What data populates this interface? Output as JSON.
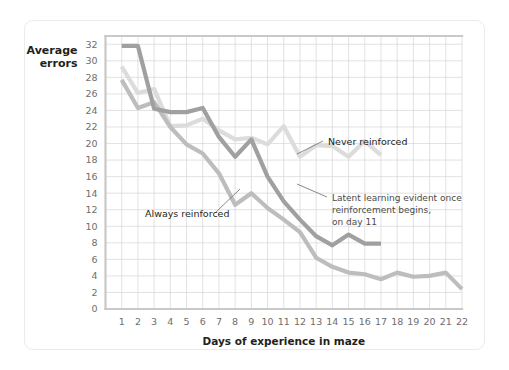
{
  "chart_data": {
    "type": "line",
    "title": "",
    "xlabel": "Days of experience in maze",
    "ylabel": "Average errors",
    "ylabel_line1": "Average",
    "ylabel_line2": "errors",
    "xlim": [
      0,
      22
    ],
    "ylim": [
      0,
      33
    ],
    "grid": true,
    "legend_position": "inline-annotations",
    "x": [
      1,
      2,
      3,
      4,
      5,
      6,
      7,
      8,
      9,
      10,
      11,
      12,
      13,
      14,
      15,
      16,
      17,
      18,
      19,
      20,
      21,
      22
    ],
    "xticks": [
      "1",
      "2",
      "3",
      "4",
      "5",
      "6",
      "7",
      "8",
      "9",
      "10",
      "11",
      "12",
      "13",
      "14",
      "15",
      "16",
      "17",
      "18",
      "19",
      "20",
      "21",
      "22"
    ],
    "yticks": [
      "0",
      "2",
      "4",
      "6",
      "8",
      "10",
      "12",
      "14",
      "16",
      "18",
      "20",
      "22",
      "24",
      "26",
      "28",
      "30",
      "32"
    ],
    "series": [
      {
        "name": "Never reinforced",
        "color": "#dcdcdc",
        "x": [
          1,
          2,
          3,
          4,
          5,
          6,
          7,
          8,
          9,
          10,
          11,
          12,
          13,
          14,
          15,
          16,
          17
        ],
        "values": [
          29.3,
          26.1,
          26.6,
          22.1,
          22.2,
          23.0,
          21.6,
          20.5,
          20.7,
          19.9,
          22.1,
          18.4,
          19.8,
          19.7,
          18.4,
          20.3,
          18.6
        ]
      },
      {
        "name": "Always reinforced",
        "color": "#bdbdbd",
        "x": [
          1,
          2,
          3,
          4,
          5,
          6,
          7,
          8,
          9,
          10,
          11,
          12,
          13,
          14,
          15,
          16,
          17,
          18,
          19,
          20,
          21,
          22
        ],
        "values": [
          27.7,
          24.3,
          25.0,
          22.0,
          19.9,
          18.8,
          16.4,
          12.6,
          14.0,
          12.2,
          10.8,
          9.3,
          6.2,
          5.1,
          4.4,
          4.2,
          3.6,
          4.4,
          3.9,
          4.0,
          4.4,
          2.4
        ]
      },
      {
        "name": "Latent learning group",
        "color": "#a0a0a0",
        "x": [
          1,
          2,
          3,
          4,
          5,
          6,
          7,
          8,
          9,
          10,
          11,
          12,
          13,
          14,
          15,
          16,
          17
        ],
        "values": [
          31.8,
          31.8,
          24.2,
          23.8,
          23.8,
          24.3,
          20.8,
          18.4,
          20.5,
          16.0,
          13.0,
          10.8,
          8.8,
          7.7,
          9.0,
          7.9,
          7.9
        ]
      }
    ],
    "annotations": [
      {
        "id": "never-reinforced",
        "text": "Never reinforced",
        "lines": [
          "Never reinforced"
        ],
        "target_x": 11,
        "target_y": 22.1
      },
      {
        "id": "always-reinforced",
        "text": "Always reinforced",
        "lines": [
          "Always reinforced"
        ],
        "target_x": 7,
        "target_y": 16.4
      },
      {
        "id": "latent-learning",
        "text": "Latent learning evident once reinforcement begins, on day 11",
        "lines": [
          "Latent learning evident once",
          "reinforcement begins,",
          "on day 11"
        ],
        "target_x": 12,
        "target_y": 10.8
      }
    ]
  }
}
